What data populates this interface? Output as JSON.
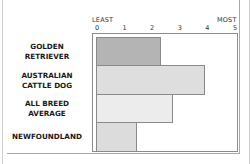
{
  "chart_data": {
    "type": "bar",
    "orientation": "horizontal",
    "title": "",
    "xlabel": "",
    "ylabel": "",
    "axis_end_labels": {
      "min": "LEAST",
      "max": "MOST"
    },
    "ticks": [
      "0",
      "1",
      "2",
      "3",
      "4",
      "5"
    ],
    "xlim": [
      0,
      5
    ],
    "grid": false,
    "categories": [
      "GOLDEN RETRIEVER",
      "AUSTRALIAN CATTLE DOG",
      "ALL BREED AVERAGE",
      "NEWFOUNDLAND"
    ],
    "label_lines": [
      [
        "GOLDEN",
        "RETRIEVER"
      ],
      [
        "AUSTRALIAN",
        "CATTLE DOG"
      ],
      [
        "ALL BREED",
        "AVERAGE"
      ],
      [
        "NEWFOUNDLAND"
      ]
    ],
    "values": [
      2.35,
      3.95,
      2.8,
      1.5
    ],
    "colors": [
      "#b4b4b4",
      "#dedede",
      "#ececec",
      "#dcdcdc"
    ]
  }
}
